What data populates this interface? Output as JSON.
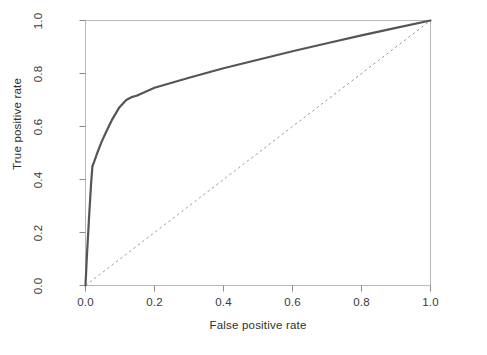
{
  "chart_data": {
    "type": "line",
    "title": "",
    "subtitle": "",
    "xlabel": "False positive rate",
    "ylabel": "True positive rate",
    "xlim": [
      0.0,
      1.0
    ],
    "ylim": [
      0.0,
      1.0
    ],
    "grid": false,
    "legend": null,
    "legend_position": "none",
    "xticks": [
      "0.0",
      "0.2",
      "0.4",
      "0.6",
      "0.8",
      "1.0"
    ],
    "xtick_values": [
      0.0,
      0.2,
      0.4,
      0.6,
      0.8,
      1.0
    ],
    "yticks": [
      "0.0",
      "0.2",
      "0.4",
      "0.6",
      "0.8",
      "1.0"
    ],
    "ytick_values": [
      0.0,
      0.2,
      0.4,
      0.6,
      0.8,
      1.0
    ],
    "series": [
      {
        "name": "ROC curve",
        "style": "solid",
        "color": "#555555",
        "width": 2.2,
        "x": [
          0.0,
          0.004,
          0.01,
          0.016,
          0.02,
          0.026,
          0.034,
          0.046,
          0.06,
          0.078,
          0.098,
          0.118,
          0.136,
          0.148,
          0.2,
          0.3,
          0.4,
          0.5,
          0.6,
          0.7,
          0.8,
          0.9,
          1.0
        ],
        "y": [
          0.0,
          0.11,
          0.25,
          0.38,
          0.45,
          0.47,
          0.5,
          0.54,
          0.58,
          0.628,
          0.672,
          0.7,
          0.712,
          0.716,
          0.746,
          0.784,
          0.82,
          0.852,
          0.884,
          0.914,
          0.944,
          0.972,
          1.0
        ]
      },
      {
        "name": "Chance diagonal",
        "style": "dashed",
        "color": "#9a9a9a",
        "width": 1.0,
        "x": [
          0.0,
          1.0
        ],
        "y": [
          0.0,
          1.0
        ]
      }
    ],
    "annotations": []
  },
  "axes": {
    "frame_color": "#b8b8b8",
    "tick_color": "#8a8a8a",
    "background": "#ffffff"
  }
}
